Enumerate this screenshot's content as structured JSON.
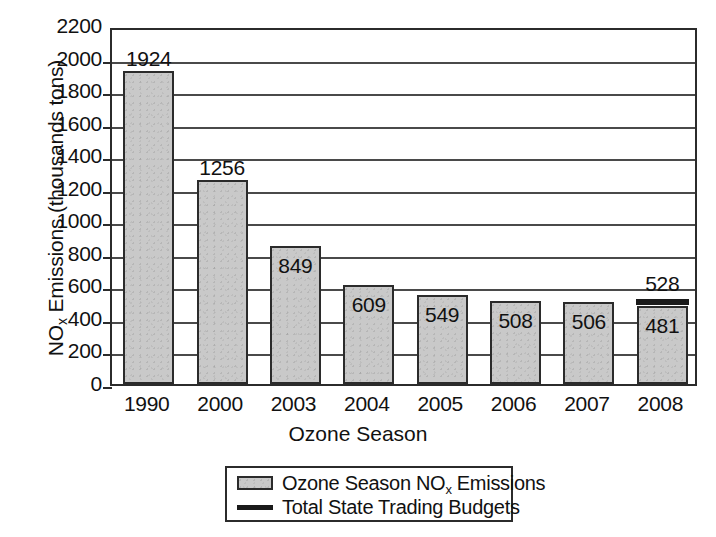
{
  "chart_data": {
    "type": "bar",
    "title": "",
    "xlabel": "Ozone Season",
    "ylabel": "NOx Emissions (thousands tons)",
    "ylabel_base": "NO",
    "ylabel_sub": "x",
    "ylabel_rest": " Emissions (thousands tons)",
    "categories": [
      "1990",
      "2000",
      "2003",
      "2004",
      "2005",
      "2006",
      "2007",
      "2008"
    ],
    "values": [
      1924,
      1256,
      849,
      609,
      549,
      508,
      506,
      481
    ],
    "value_labels": [
      "1924",
      "1256",
      "849",
      "609",
      "549",
      "508",
      "506",
      "481"
    ],
    "label_position": [
      "above",
      "above",
      "inside",
      "inside",
      "inside",
      "inside",
      "inside",
      "inside"
    ],
    "series": [
      {
        "name": "Ozone Season NOx Emissions",
        "values": [
          1924,
          1256,
          849,
          609,
          549,
          508,
          506,
          481
        ]
      },
      {
        "name": "Total State Trading Budgets",
        "values": [
          null,
          null,
          null,
          null,
          null,
          null,
          null,
          528
        ]
      }
    ],
    "marker_overlay": {
      "category": "2008",
      "value": 528,
      "label": "528"
    },
    "ylim": [
      0,
      2200
    ],
    "ytick_step": 200,
    "ytick_labels": [
      "2200",
      "2000",
      "1800",
      "1600",
      "1400",
      "1200",
      "1000",
      "800",
      "600",
      "400",
      "200",
      "0"
    ],
    "ytick_values": [
      2200,
      2000,
      1800,
      1600,
      1400,
      1200,
      1000,
      800,
      600,
      400,
      200,
      0
    ],
    "grid": true,
    "grid_axis": "y",
    "legend_position": "bottom-center",
    "colors": {
      "bar_fill": "#c9c9c9",
      "bar_stroke": "#2b2b2b",
      "budget_line": "#1a1a1a",
      "grid": "#4a4a4a",
      "text": "#111111",
      "background": "#ffffff"
    }
  },
  "legend": {
    "items": [
      {
        "marker": "filled-box",
        "label": "Ozone Season NOx Emissions",
        "label_pre": "Ozone Season NO",
        "label_sub": "x",
        "label_post": " Emissions"
      },
      {
        "marker": "thick-line",
        "label": "Total State Trading Budgets",
        "label_pre": "Total State Trading Budgets",
        "label_sub": "",
        "label_post": ""
      }
    ]
  }
}
